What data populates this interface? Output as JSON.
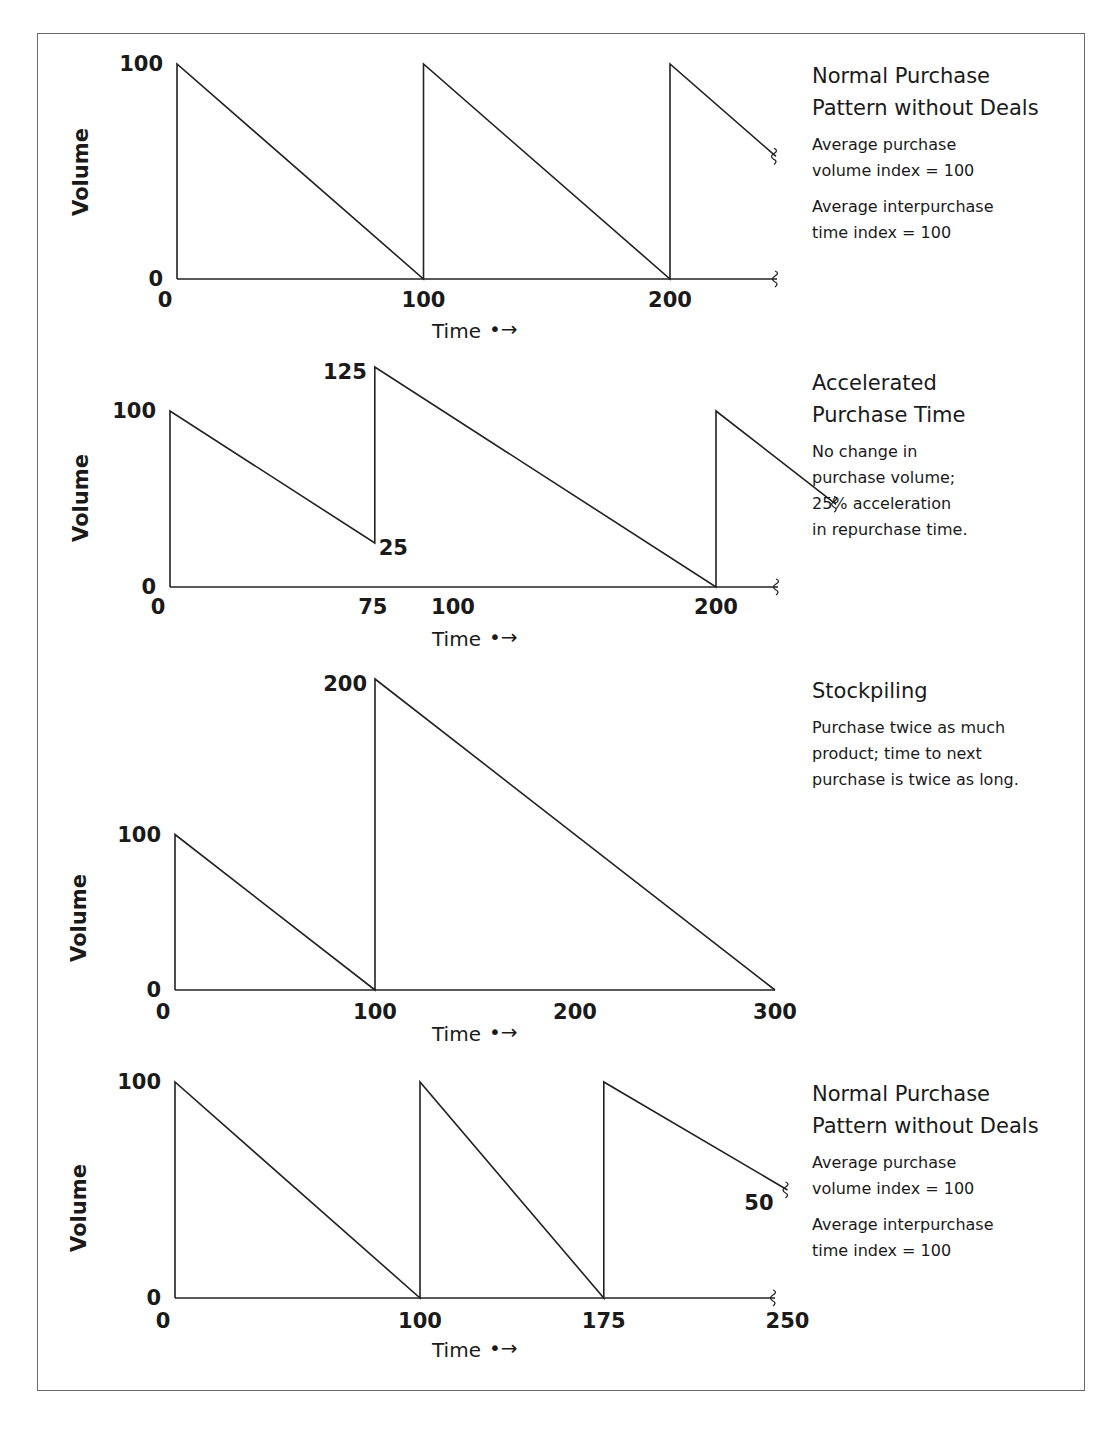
{
  "chart_data": [
    {
      "type": "line",
      "title": "Normal Purchase Pattern without Deals",
      "notes": [
        "Average purchase\nvolume index = 100",
        "Average interpurchase\ntime index = 100"
      ],
      "xlabel": "Time",
      "ylabel": "Volume",
      "x_ticks": [
        0,
        100,
        200
      ],
      "y_ticks": [
        0,
        100
      ],
      "xlim": [
        0,
        250
      ],
      "ylim": [
        0,
        100
      ],
      "axis_break": true,
      "points": [
        [
          0,
          0
        ],
        [
          0,
          100
        ],
        [
          100,
          0
        ],
        [
          100,
          100
        ],
        [
          200,
          0
        ],
        [
          200,
          100
        ],
        [
          243,
          57
        ]
      ],
      "annotations": []
    },
    {
      "type": "line",
      "title": "Accelerated\nPurchase Time",
      "notes": [
        "No change in\npurchase volume;\n25% acceleration\nin repurchase time."
      ],
      "xlabel": "Time",
      "ylabel": "Volume",
      "x_ticks": [
        0,
        75,
        100,
        200
      ],
      "y_ticks": [
        0,
        100
      ],
      "xlim": [
        0,
        250
      ],
      "ylim": [
        0,
        100
      ],
      "axis_break": true,
      "points": [
        [
          0,
          0
        ],
        [
          0,
          100
        ],
        [
          75,
          25
        ],
        [
          75,
          125
        ],
        [
          200,
          0
        ],
        [
          200,
          100
        ],
        [
          244,
          47
        ]
      ],
      "annotations": [
        {
          "text": "125",
          "x": 75,
          "y": 125,
          "pos": "left"
        },
        {
          "text": "25",
          "x": 75,
          "y": 25,
          "pos": "right-below"
        }
      ]
    },
    {
      "type": "line",
      "title": "Stockpiling",
      "notes": [
        "Purchase twice as much\nproduct; time to next\npurchase is twice as long."
      ],
      "xlabel": "Time",
      "ylabel": "Volume",
      "x_ticks": [
        0,
        100,
        200,
        300
      ],
      "y_ticks": [
        0,
        100
      ],
      "xlim": [
        0,
        300
      ],
      "ylim": [
        0,
        200
      ],
      "axis_break": false,
      "points": [
        [
          0,
          0
        ],
        [
          0,
          100
        ],
        [
          100,
          0
        ],
        [
          100,
          200
        ],
        [
          300,
          0
        ]
      ],
      "annotations": [
        {
          "text": "200",
          "x": 100,
          "y": 200,
          "pos": "left"
        }
      ]
    },
    {
      "type": "line",
      "title": "Normal Purchase\nPattern without Deals",
      "notes": [
        "Average purchase\nvolume index = 100",
        "Average interpurchase\ntime index = 100"
      ],
      "xlabel": "Time",
      "ylabel": "Volume",
      "x_ticks": [
        0,
        100,
        175,
        250
      ],
      "y_ticks": [
        0,
        100
      ],
      "xlim": [
        0,
        250
      ],
      "ylim": [
        0,
        100
      ],
      "axis_break": true,
      "points": [
        [
          0,
          0
        ],
        [
          0,
          100
        ],
        [
          100,
          0
        ],
        [
          100,
          100
        ],
        [
          175,
          0
        ],
        [
          175,
          100
        ],
        [
          250,
          50
        ]
      ],
      "annotations": [
        {
          "text": "50",
          "x": 250,
          "y": 50,
          "pos": "left-below"
        }
      ]
    }
  ],
  "panels": [
    {
      "title": "Normal Purchase\nPattern without Deals",
      "notes": [
        "Average purchase\nvolume index = 100",
        "Average interpurchase\ntime index = 100"
      ]
    },
    {
      "title": "Accelerated\nPurchase Time",
      "notes": [
        "No change in\npurchase volume;\n25% acceleration\nin repurchase time."
      ]
    },
    {
      "title": "Stockpiling",
      "notes": [
        "Purchase twice as much\nproduct; time to next\npurchase is twice as long."
      ]
    },
    {
      "title": "Normal Purchase\nPattern without Deals",
      "notes": [
        "Average purchase\nvolume index = 100",
        "Average interpurchase\ntime index = 100"
      ]
    }
  ],
  "labels": {
    "xlabel": "Time",
    "ylabel": "Volume",
    "arrow_glyph": "•→"
  }
}
